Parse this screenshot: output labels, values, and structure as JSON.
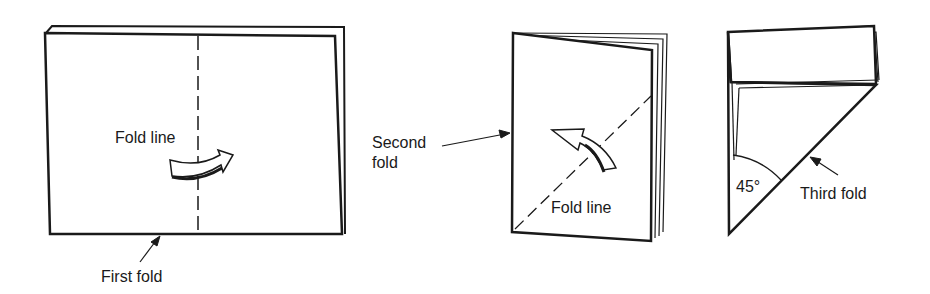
{
  "figure": {
    "panels": [
      {
        "id": "step-1",
        "labels": {
          "fold_line": "Fold line",
          "fold_name": "First fold"
        },
        "arrow_direction": "right"
      },
      {
        "id": "step-2",
        "labels": {
          "fold_name_line1": "Second",
          "fold_name_line2": "fold",
          "fold_line": "Fold line"
        },
        "arrow_direction": "up-left"
      },
      {
        "id": "step-3",
        "labels": {
          "angle": "45°",
          "fold_name": "Third fold"
        }
      }
    ],
    "colors": {
      "stroke": "#1a1a1a",
      "background": "#ffffff"
    }
  }
}
